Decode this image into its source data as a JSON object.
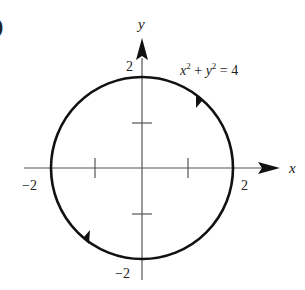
{
  "figure": {
    "part_label": ")",
    "equation": {
      "x": "x",
      "x_exp": "2",
      "plus": " + ",
      "y": "y",
      "y_exp": "2",
      "rhs": " = 4"
    },
    "axes": {
      "x_label": "x",
      "y_label": "y",
      "x_ticks": [
        "−2",
        "2"
      ],
      "y_ticks": [
        "2",
        "−2"
      ]
    },
    "curve": {
      "type": "circle",
      "equation": "x^2 + y^2 = 4",
      "center": [
        0,
        0
      ],
      "radius": 2,
      "orientation": "counterclockwise",
      "arrow_positions": [
        "upper-right",
        "lower-left"
      ]
    },
    "colors": {
      "curve": "#111111",
      "axes": "#555555",
      "text": "#222222"
    }
  }
}
